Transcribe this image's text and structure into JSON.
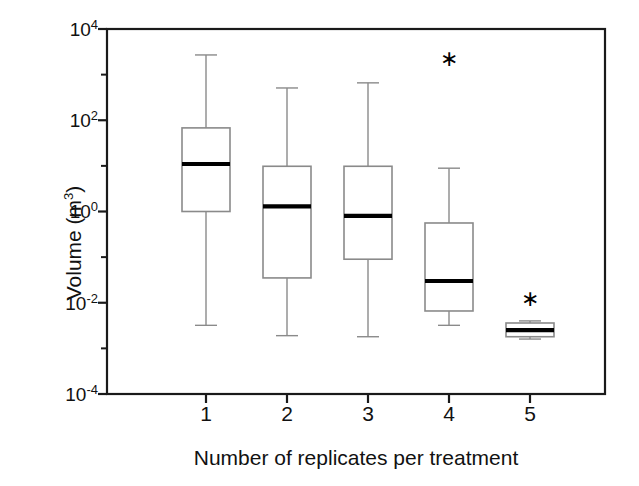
{
  "chart_data": {
    "type": "box",
    "title": "",
    "xlabel": "Number of replicates per treatment",
    "ylabel": "Volume (m",
    "ylabel_sup": "3",
    "ylabel_close": ")",
    "yscale": "log",
    "ylim": [
      0.0001,
      10000
    ],
    "grid": false,
    "legend": "none",
    "ytick_labels": [
      "10",
      "10",
      "10",
      "10",
      "10"
    ],
    "ytick_exponents": [
      "4",
      "2",
      "0",
      "-2",
      "-4"
    ],
    "ytick_values": [
      10000,
      100,
      1,
      0.01,
      0.0001
    ],
    "yminor_values": [
      1000,
      10,
      0.1,
      0.001
    ],
    "categories": [
      "1",
      "2",
      "3",
      "4",
      "5"
    ],
    "boxes": [
      {
        "category": "1",
        "whisker_high": 2700,
        "q3": 68,
        "median": 11,
        "q1": 1.0,
        "whisker_low": 0.0032,
        "outliers": []
      },
      {
        "category": "2",
        "whisker_high": 510,
        "q3": 9.8,
        "median": 1.3,
        "q1": 0.035,
        "whisker_low": 0.0019,
        "outliers": []
      },
      {
        "category": "3",
        "whisker_high": 660,
        "q3": 9.8,
        "median": 0.8,
        "q1": 0.09,
        "whisker_low": 0.0018,
        "outliers": []
      },
      {
        "category": "4",
        "whisker_high": 8.9,
        "q3": 0.56,
        "median": 0.03,
        "q1": 0.0066,
        "whisker_low": 0.0032,
        "outliers": [
          2200
        ]
      },
      {
        "category": "5",
        "whisker_high": 0.004,
        "q3": 0.0036,
        "median": 0.0025,
        "q1": 0.0018,
        "whisker_low": 0.0016,
        "outliers": [
          0.012
        ]
      }
    ],
    "colors": {
      "axis": "#1a1a1a",
      "box_edge": "#8a8a8a",
      "median": "#000000",
      "whisker": "#8a8a8a",
      "outlier": "#000000",
      "background": "#ffffff"
    },
    "outlier_marker": "asterisk"
  }
}
